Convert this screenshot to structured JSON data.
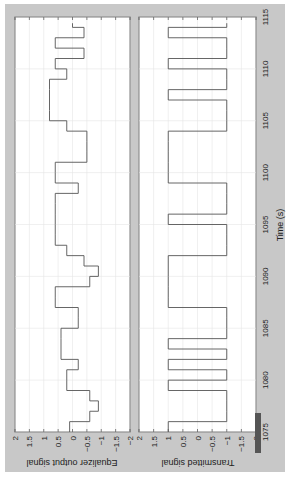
{
  "figure": {
    "background": "#c8c8c8",
    "plot_background": "#ffffff",
    "line_color": "#555555",
    "grid_color": "#e6e6e6",
    "orientation": "rotated-90-clockwise"
  },
  "chart_data": [
    {
      "type": "line",
      "title": "",
      "ylabel": "Equalizer output signal",
      "xlabel": "",
      "ylim": [
        -2,
        2
      ],
      "xlim": [
        1075,
        1115
      ],
      "yticks": [
        "2",
        "1.5",
        "1",
        "0.5",
        "0",
        "-0.5",
        "-1",
        "-1.5",
        "-2"
      ],
      "grid": true,
      "step": true,
      "series": [
        {
          "name": "Equalizer output",
          "x": [
            1075,
            1076,
            1077,
            1078,
            1079,
            1080,
            1081,
            1082,
            1083,
            1084,
            1085,
            1086,
            1087,
            1088,
            1089,
            1090,
            1091,
            1092,
            1093,
            1094,
            1095,
            1096,
            1097,
            1098,
            1099,
            1100,
            1101,
            1102,
            1103,
            1104,
            1105,
            1106,
            1107,
            1108,
            1109,
            1110,
            1111,
            1112,
            1113,
            1114
          ],
          "values": [
            0.1,
            -0.6,
            -0.9,
            -0.6,
            0.2,
            0.2,
            -0.2,
            0.4,
            0.4,
            0.4,
            -0.2,
            -0.2,
            0.6,
            0.6,
            -0.6,
            -0.9,
            -0.4,
            0.2,
            0.6,
            0.6,
            0.6,
            0.6,
            0.6,
            -0.2,
            0.6,
            0.6,
            -0.5,
            -0.5,
            -0.5,
            0.2,
            0.8,
            0.8,
            0.8,
            0.8,
            0.2,
            0.6,
            -0.4,
            0.6,
            -0.4,
            0.0
          ]
        }
      ]
    },
    {
      "type": "line",
      "title": "",
      "ylabel": "Transmitted signal",
      "xlabel": "Time (s)",
      "ylim": [
        -2,
        2
      ],
      "xlim": [
        1075,
        1115
      ],
      "xticks": [
        "1075",
        "1080",
        "1085",
        "1090",
        "1095",
        "1100",
        "1105",
        "1110",
        "1115"
      ],
      "yticks": [
        "2",
        "1.5",
        "1",
        "0.5",
        "0",
        "-0.5",
        "-1",
        "-1.5",
        "-2"
      ],
      "grid": true,
      "step": true,
      "series": [
        {
          "name": "Transmitted",
          "x": [
            1075,
            1076,
            1077,
            1078,
            1079,
            1080,
            1081,
            1082,
            1083,
            1084,
            1085,
            1086,
            1087,
            1088,
            1089,
            1090,
            1091,
            1092,
            1093,
            1094,
            1095,
            1096,
            1097,
            1098,
            1099,
            1100,
            1101,
            1102,
            1103,
            1104,
            1105,
            1106,
            1107,
            1108,
            1109,
            1110,
            1111,
            1112,
            1113,
            1114
          ],
          "values": [
            1,
            -1,
            -1,
            -1,
            1,
            -1,
            1,
            -1,
            1,
            -1,
            -1,
            -1,
            1,
            1,
            1,
            1,
            1,
            -1,
            -1,
            -1,
            1,
            -1,
            -1,
            -1,
            1,
            1,
            1,
            1,
            1,
            -1,
            -1,
            -1,
            1,
            -1,
            -1,
            1,
            -1,
            -1,
            1,
            -1
          ]
        }
      ]
    }
  ],
  "labels": {
    "panel1_ylabel": "Equalizer output signal",
    "panel2_ylabel": "Transmitted signal",
    "xlabel": "Time (s)",
    "value_ticks": [
      "2",
      "1.5",
      "1",
      "0.5",
      "0",
      "−0.5",
      "−1",
      "−1.5",
      "−2"
    ],
    "time_ticks": [
      "1075",
      "1080",
      "1085",
      "1090",
      "1095",
      "1100",
      "1105",
      "1110",
      "1115"
    ]
  }
}
